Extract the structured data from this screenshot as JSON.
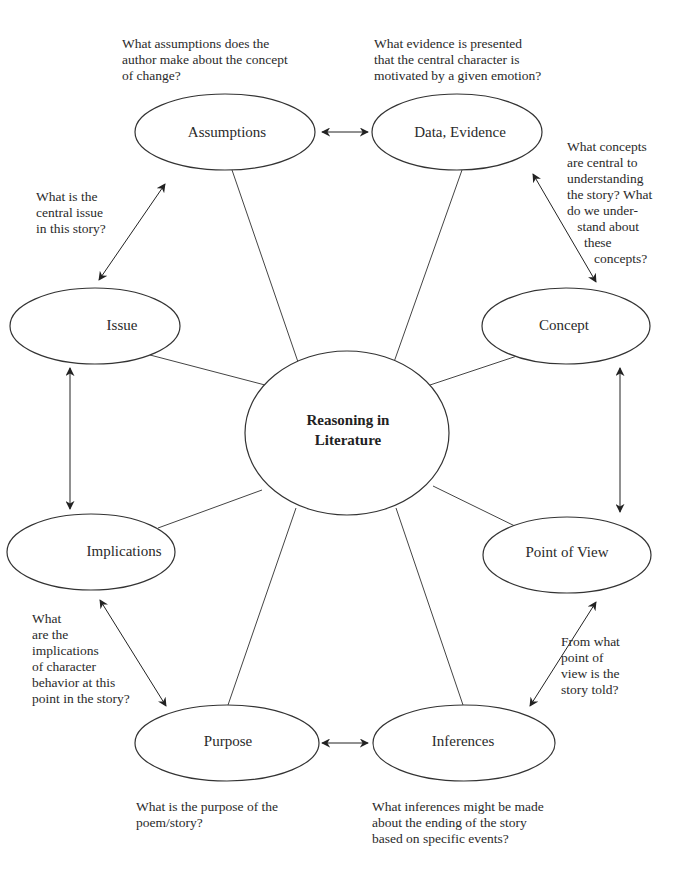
{
  "center": {
    "line1": "Reasoning in",
    "line2": "Literature"
  },
  "nodes": {
    "assumptions": "Assumptions",
    "data_evidence": "Data, Evidence",
    "issue": "Issue",
    "concept": "Concept",
    "implications": "Implications",
    "point_of_view": "Point of View",
    "purpose": "Purpose",
    "inferences": "Inferences"
  },
  "questions": {
    "assumptions": "What assumptions does the\nauthor make about the concept\nof change?",
    "data_evidence": "What evidence is presented\nthat the central character is\nmotivated by a given emotion?",
    "concept": "What concepts\nare central to\nunderstanding\nthe story? What\ndo we under-\n   stand about\n     these\n        concepts?",
    "issue": "What is the\ncentral issue\nin this story?",
    "implications": "What\nare the\nimplications\nof character\nbehavior at this\npoint in the story?",
    "point_of_view": "From what\npoint of\nview is the\nstory told?",
    "purpose": "What is the purpose of the\npoem/story?",
    "inferences": "What inferences might be made\nabout the ending of the story\nbased on specific events?"
  },
  "colors": {
    "stroke": "#333333",
    "text": "#2a2a2a",
    "background": "#ffffff"
  }
}
